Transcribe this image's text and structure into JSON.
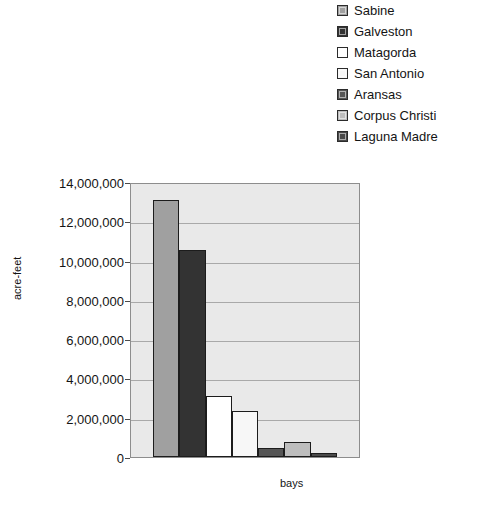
{
  "chart_data": {
    "type": "bar",
    "title": "",
    "subtitle": "",
    "xlabel": "bays",
    "ylabel": "acre-feet",
    "ylim": [
      0,
      14000000
    ],
    "ytick_labels": [
      "14,000,000",
      "12,000,000",
      "10,000,000",
      "8,000,000",
      "6,000,000",
      "4,000,000",
      "2,000,000",
      "0"
    ],
    "ytick_values": [
      14000000,
      12000000,
      10000000,
      8000000,
      6000000,
      4000000,
      2000000,
      0
    ],
    "grid": true,
    "legend_position": "top-right",
    "categories": [
      "Sabine",
      "Galveston",
      "Matagorda",
      "San Antonio",
      "Aransas",
      "Corpus Christi",
      "Laguna Madre"
    ],
    "values": [
      13100000,
      10550000,
      3100000,
      2350000,
      450000,
      750000,
      200000
    ],
    "colors": [
      "#a0a0a0",
      "#333333",
      "#ffffff",
      "#f7f7f7",
      "#555555",
      "#bdbdbd",
      "#4a4a4a"
    ],
    "series": [
      {
        "name": "acre-feet",
        "values": [
          13100000,
          10550000,
          3100000,
          2350000,
          450000,
          750000,
          200000
        ]
      }
    ]
  },
  "legend": {
    "items": [
      {
        "label": "Sabine",
        "color": "#a0a0a0"
      },
      {
        "label": "Galveston",
        "color": "#333333"
      },
      {
        "label": "Matagorda",
        "color": "#ffffff"
      },
      {
        "label": "San Antonio",
        "color": "#f7f7f7"
      },
      {
        "label": "Aransas",
        "color": "#555555"
      },
      {
        "label": "Corpus Christi",
        "color": "#bdbdbd"
      },
      {
        "label": "Laguna Madre",
        "color": "#4a4a4a"
      }
    ]
  },
  "axes": {
    "y_title": "acre-feet",
    "x_title": "bays"
  }
}
